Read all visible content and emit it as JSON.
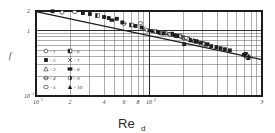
{
  "chart_data": {
    "type": "scatter",
    "title": "",
    "xlabel": "Re",
    "xlabel_sub": "d",
    "ylabel": "f",
    "xscale": "log",
    "yscale": "log",
    "xlim": [
      10,
      1000
    ],
    "ylim": [
      0.1,
      2
    ],
    "grid": true,
    "legend_position": "inside-lower-left",
    "x_ticks": [
      {
        "value": 10,
        "label": "10",
        "sup": "1"
      },
      {
        "value": 20,
        "label": "2",
        "sup": ""
      },
      {
        "value": 40,
        "label": "4",
        "sup": ""
      },
      {
        "value": 60,
        "label": "6",
        "sup": ""
      },
      {
        "value": 80,
        "label": "8",
        "sup": ""
      },
      {
        "value": 100,
        "label": "10",
        "sup": "2"
      },
      {
        "value": 1000,
        "label": "3",
        "sup": ""
      }
    ],
    "y_ticks": [
      {
        "value": 2,
        "label": "2",
        "sup": ""
      },
      {
        "value": 1,
        "label": "1",
        "sup": ""
      },
      {
        "value": 0.1,
        "label": "10",
        "sup": "-1"
      }
    ],
    "trend_line": {
      "label": "fit",
      "x_start": 10,
      "y_start": 1.95,
      "x_end": 1000,
      "y_end": 0.36
    },
    "series": [
      {
        "name": "1",
        "marker": "open-circle",
        "points": [
          [
            17,
            1.9
          ],
          [
            96,
            1.02
          ],
          [
            118,
            0.96
          ],
          [
            150,
            0.88
          ],
          [
            196,
            0.8
          ],
          [
            210,
            0.76
          ],
          [
            700,
            0.42
          ],
          [
            760,
            0.4
          ]
        ]
      },
      {
        "name": "2",
        "marker": "filled-square",
        "points": [
          [
            26,
            1.86
          ],
          [
            40,
            1.62
          ],
          [
            52,
            1.52
          ],
          [
            86,
            1.12
          ],
          [
            160,
            0.9
          ],
          [
            230,
            0.72
          ],
          [
            330,
            0.62
          ],
          [
            720,
            0.44
          ]
        ]
      },
      {
        "name": "3",
        "marker": "open-triangle",
        "points": [
          [
            130,
            0.92
          ],
          [
            175,
            0.84
          ],
          [
            205,
            0.78
          ],
          [
            250,
            0.7
          ],
          [
            690,
            0.43
          ],
          [
            740,
            0.41
          ]
        ]
      },
      {
        "name": "4",
        "marker": "cross-circle",
        "points": [
          [
            60,
            1.28
          ],
          [
            110,
            0.98
          ],
          [
            190,
            0.82
          ],
          [
            280,
            0.66
          ],
          [
            710,
            0.42
          ]
        ]
      },
      {
        "name": "5",
        "marker": "open-ellipse",
        "points": [
          [
            22,
            1.93
          ],
          [
            84,
            1.3
          ],
          [
            140,
            0.92
          ],
          [
            215,
            0.77
          ],
          [
            300,
            0.64
          ],
          [
            750,
            0.4
          ]
        ]
      },
      {
        "name": "6",
        "marker": "half-square",
        "points": [
          [
            35,
            1.7
          ],
          [
            70,
            1.22
          ],
          [
            125,
            0.94
          ],
          [
            185,
            0.83
          ],
          [
            260,
            0.69
          ],
          [
            730,
            0.41
          ]
        ]
      },
      {
        "name": "7",
        "marker": "x-mark",
        "points": [
          [
            90,
            1.08
          ],
          [
            145,
            0.89
          ],
          [
            200,
            0.79
          ],
          [
            240,
            0.72
          ],
          [
            770,
            0.39
          ]
        ]
      },
      {
        "name": "8",
        "marker": "filled-rect",
        "points": [
          [
            47,
            1.45
          ],
          [
            102,
            1.0
          ],
          [
            165,
            0.86
          ],
          [
            290,
            0.65
          ],
          [
            700,
            0.43
          ]
        ]
      },
      {
        "name": "9",
        "marker": "split-circle",
        "points": [
          [
            115,
            0.97
          ],
          [
            155,
            0.87
          ],
          [
            225,
            0.74
          ],
          [
            310,
            0.63
          ],
          [
            745,
            0.4
          ]
        ]
      },
      {
        "name": "10",
        "marker": "filled-triangle",
        "points": [
          [
            108,
            0.99
          ],
          [
            170,
            0.85
          ],
          [
            235,
            0.71
          ],
          [
            320,
            0.61
          ],
          [
            755,
            0.38
          ]
        ]
      }
    ],
    "outliers": [
      [
        14,
        1.98
      ],
      [
        30,
        1.8
      ],
      [
        44,
        1.56
      ],
      [
        58,
        1.34
      ],
      [
        76,
        1.18
      ],
      [
        122,
        0.95
      ],
      [
        135,
        0.91
      ],
      [
        178,
        0.83
      ],
      [
        205,
        0.62
      ],
      [
        265,
        0.68
      ],
      [
        355,
        0.58
      ],
      [
        395,
        0.56
      ],
      [
        430,
        0.54
      ],
      [
        470,
        0.52
      ],
      [
        520,
        0.5
      ]
    ]
  },
  "legend": {
    "entries": [
      {
        "id": "1",
        "dash": "-",
        "label": "1",
        "marker": "open-circle",
        "col": 0
      },
      {
        "id": "2",
        "dash": "-",
        "label": "2",
        "marker": "filled-square",
        "col": 0
      },
      {
        "id": "3",
        "dash": "-",
        "label": "3",
        "marker": "open-triangle",
        "col": 0
      },
      {
        "id": "4",
        "dash": "-",
        "label": "4",
        "marker": "cross-circle",
        "col": 0
      },
      {
        "id": "5",
        "dash": "-",
        "label": "5",
        "marker": "open-ellipse",
        "col": 0
      },
      {
        "id": "6",
        "dash": "-",
        "label": "6",
        "marker": "half-square",
        "col": 1
      },
      {
        "id": "7",
        "dash": "-",
        "label": "7",
        "marker": "x-mark",
        "col": 1
      },
      {
        "id": "8",
        "dash": "-",
        "label": "8",
        "marker": "filled-rect",
        "col": 1
      },
      {
        "id": "9",
        "dash": "-",
        "label": "9",
        "marker": "split-circle",
        "col": 1
      },
      {
        "id": "10",
        "dash": "-",
        "label": "10",
        "marker": "filled-triangle",
        "col": 1
      }
    ]
  },
  "colors": {
    "ink": "#1d1d1d",
    "grid": "#4a4a4a",
    "frame": "#1d1d1d",
    "background": "#ffffff",
    "text": "#2e2e2e"
  }
}
